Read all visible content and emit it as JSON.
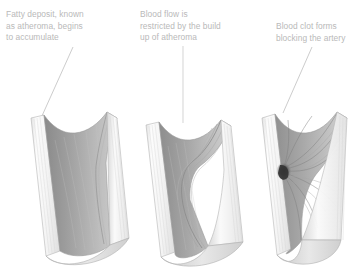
{
  "figure": {
    "type": "medical-illustration",
    "panel_count": 3,
    "background_color": "#ffffff"
  },
  "captions": [
    {
      "id": "caption-fatty-deposit",
      "text": "Fatty deposit, known\nas atheroma, begins\nto accumulate",
      "color": "#b9b9b9"
    },
    {
      "id": "caption-blood-flow",
      "text": "Blood flow is\nrestricted by the build\nup of atheroma",
      "color": "#b9b9b9"
    },
    {
      "id": "caption-blood-clot",
      "text": "Blood clot forms\nblocking the artery",
      "color": "#b9b9b9"
    }
  ],
  "leader_lines": [
    {
      "id": "leader-1",
      "from_caption": "caption-fatty-deposit",
      "slope": "down-left"
    },
    {
      "id": "leader-2",
      "from_caption": "caption-blood-flow",
      "slope": "vertical"
    },
    {
      "id": "leader-3",
      "from_caption": "caption-blood-clot",
      "slope": "down-left"
    }
  ],
  "arteries": [
    {
      "id": "artery-stage-1",
      "stage": "early atheroma",
      "label": "Fatty deposit begins to accumulate",
      "has_clot": false,
      "narrowing": "slight"
    },
    {
      "id": "artery-stage-2",
      "stage": "restricted flow",
      "label": "Blood flow restricted by atheroma build up",
      "has_clot": false,
      "narrowing": "moderate"
    },
    {
      "id": "artery-stage-3",
      "stage": "occlusion",
      "label": "Blood clot blocking the artery",
      "has_clot": true,
      "narrowing": "complete"
    }
  ],
  "colors": {
    "wall_light": "#fbfbfb",
    "wall_shade": "#e6e6e6",
    "wall_line": "#cfcfcf",
    "lumen_dark": "#8f8f8f",
    "lumen_mid": "#a8a8a8",
    "lumen_light": "#c8c8c8",
    "outline": "#9a9a9a",
    "clot_dark": "#3a3a3a",
    "caption_text": "#b9b9b9",
    "leader": "#bdbdbd"
  }
}
